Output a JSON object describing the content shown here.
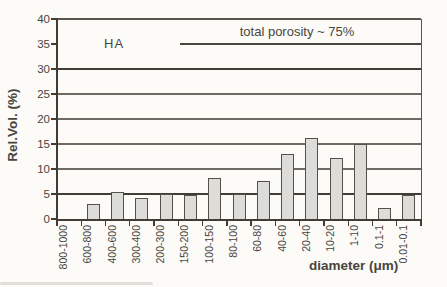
{
  "figure": {
    "background": "#fcfbf7",
    "annotations": {
      "sample_label": "HA",
      "porosity_note": "total porosity ~ 75%"
    },
    "colors": {
      "bar_fill": "#dcdcd8",
      "bar_border": "#55514a",
      "grid_thin": "#6e6a63",
      "grid_thick": "#403d37",
      "axis": "#403d37",
      "plot_border": "#5a564f",
      "text": "#49453e",
      "note_line": "#4a463f"
    }
  },
  "chart_data": {
    "type": "bar",
    "title": "",
    "categories": [
      "800-1000",
      "600-800",
      "400-600",
      "300-400",
      "200-300",
      "150-200",
      "100-150",
      "80-100",
      "60-80",
      "40-60",
      "20-40",
      "10-20",
      "1-10",
      "0.1-1",
      "0.01-0.1"
    ],
    "values": [
      0,
      3.0,
      5.4,
      4.2,
      5.0,
      4.9,
      8.3,
      5.0,
      7.6,
      13.0,
      16.2,
      12.3,
      15.1,
      2.2,
      4.8
    ],
    "xlabel": "diameter (μm)",
    "ylabel": "Rel.Vol. (%)",
    "ylim": [
      0,
      40
    ],
    "yticks": [
      0,
      5,
      10,
      15,
      20,
      25,
      30,
      35,
      40
    ],
    "gridlines_at": [
      10,
      15,
      20,
      25,
      30,
      40
    ],
    "thick_gridlines_at": [
      5,
      30
    ],
    "no_gridline_at": [
      35
    ],
    "grid": "horizontal",
    "legend": "none",
    "annotation_underline_value": 35
  }
}
